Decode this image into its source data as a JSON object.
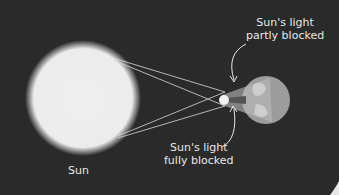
{
  "diagram": {
    "labels": {
      "sun": "Sun",
      "partial_line1": "Sun's light",
      "partial_line2": "partly blocked",
      "full_line1": "Sun's light",
      "full_line2": "fully blocked"
    },
    "colors": {
      "background": "#2a2a2a",
      "sun": "#eeeeee",
      "earth": "#9a9a9a",
      "moon": "#f2f2f2",
      "lines": "#d8d8d8",
      "text": "#e8e8e8"
    }
  }
}
